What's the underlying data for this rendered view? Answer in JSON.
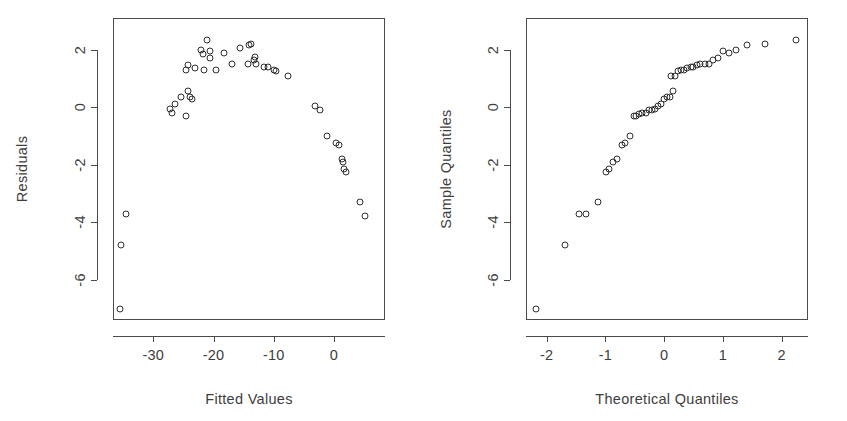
{
  "figure": {
    "background_color": "#ffffff",
    "foreground_color": "#3d3d3d",
    "point_color": "#2e2e2e"
  },
  "chart_data": [
    {
      "type": "scatter",
      "title": "",
      "xlabel": "Fitted Values",
      "ylabel": "Residuals",
      "xlim": [
        -36.7,
        8.5
      ],
      "ylim": [
        -7.4,
        3.1
      ],
      "xticks": [
        -30,
        -20,
        -10,
        0
      ],
      "xticklabels": [
        "-30",
        "-20",
        "-10",
        "0"
      ],
      "yticks": [
        2,
        0,
        -2,
        -4,
        -6
      ],
      "yticklabels": [
        "2",
        "0",
        "-2",
        "-4",
        "-6"
      ],
      "grid": false,
      "legend": "none",
      "marker": "open-circle",
      "n_points": 48,
      "points": [
        [
          -35.5,
          -7.0
        ],
        [
          -35.3,
          -4.8
        ],
        [
          -34.5,
          -3.7
        ],
        [
          -27.2,
          -0.05
        ],
        [
          -26.9,
          -0.2
        ],
        [
          -26.4,
          0.1
        ],
        [
          -25.4,
          0.35
        ],
        [
          -24.6,
          -0.3
        ],
        [
          -24.2,
          0.55
        ],
        [
          -23.9,
          0.35
        ],
        [
          -23.5,
          0.3
        ],
        [
          -24.2,
          1.45
        ],
        [
          -24.6,
          1.3
        ],
        [
          -23.0,
          1.35
        ],
        [
          -22.0,
          2.0
        ],
        [
          -21.7,
          1.85
        ],
        [
          -21.5,
          1.3
        ],
        [
          -21.0,
          2.35
        ],
        [
          -20.6,
          1.95
        ],
        [
          -20.5,
          1.7
        ],
        [
          -19.6,
          1.3
        ],
        [
          -18.3,
          1.9
        ],
        [
          -17.0,
          1.5
        ],
        [
          -15.6,
          2.05
        ],
        [
          -14.1,
          2.15
        ],
        [
          -13.7,
          2.2
        ],
        [
          -13.3,
          1.65
        ],
        [
          -13.1,
          1.75
        ],
        [
          -13.0,
          1.5
        ],
        [
          -14.2,
          1.5
        ],
        [
          -11.6,
          1.4
        ],
        [
          -11.0,
          1.4
        ],
        [
          -9.9,
          1.3
        ],
        [
          -9.6,
          1.25
        ],
        [
          -7.6,
          1.1
        ],
        [
          -3.1,
          0.05
        ],
        [
          -2.3,
          -0.1
        ],
        [
          -1.1,
          -1.0
        ],
        [
          0.3,
          -1.25
        ],
        [
          0.8,
          -1.3
        ],
        [
          1.4,
          -1.8
        ],
        [
          1.6,
          -1.9
        ],
        [
          1.7,
          -2.15
        ],
        [
          2.0,
          -2.25
        ],
        [
          4.3,
          -3.3
        ],
        [
          5.2,
          -3.8
        ]
      ]
    },
    {
      "type": "scatter",
      "title": "",
      "xlabel": "Theoretical Quantiles",
      "ylabel": "Sample Quantiles",
      "xlim": [
        -2.35,
        2.45
      ],
      "ylim": [
        -7.4,
        3.1
      ],
      "xticks": [
        -2,
        -1,
        0,
        1,
        2
      ],
      "xticklabels": [
        "-2",
        "-1",
        "0",
        "1",
        "2"
      ],
      "yticks": [
        2,
        0,
        -2,
        -4,
        -6
      ],
      "yticklabels": [
        "2",
        "0",
        "-2",
        "-4",
        "-6"
      ],
      "grid": false,
      "legend": "none",
      "marker": "open-circle",
      "n_points": 46,
      "points": [
        [
          -2.18,
          -7.0
        ],
        [
          -1.68,
          -4.8
        ],
        [
          -1.44,
          -3.7
        ],
        [
          -1.33,
          -3.7
        ],
        [
          -1.12,
          -3.3
        ],
        [
          -0.98,
          -2.25
        ],
        [
          -0.93,
          -2.15
        ],
        [
          -0.87,
          -1.9
        ],
        [
          -0.8,
          -1.8
        ],
        [
          -0.72,
          -1.3
        ],
        [
          -0.66,
          -1.25
        ],
        [
          -0.58,
          -1.0
        ],
        [
          -0.52,
          -0.3
        ],
        [
          -0.47,
          -0.3
        ],
        [
          -0.42,
          -0.25
        ],
        [
          -0.37,
          -0.2
        ],
        [
          -0.31,
          -0.2
        ],
        [
          -0.26,
          -0.1
        ],
        [
          -0.21,
          -0.1
        ],
        [
          -0.16,
          -0.05
        ],
        [
          -0.1,
          0.05
        ],
        [
          -0.05,
          0.1
        ],
        [
          0.0,
          0.3
        ],
        [
          0.05,
          0.35
        ],
        [
          0.1,
          0.35
        ],
        [
          0.15,
          0.55
        ],
        [
          0.12,
          1.1
        ],
        [
          0.18,
          1.1
        ],
        [
          0.24,
          1.25
        ],
        [
          0.29,
          1.3
        ],
        [
          0.34,
          1.3
        ],
        [
          0.39,
          1.35
        ],
        [
          0.45,
          1.4
        ],
        [
          0.5,
          1.4
        ],
        [
          0.56,
          1.45
        ],
        [
          0.62,
          1.5
        ],
        [
          0.69,
          1.5
        ],
        [
          0.76,
          1.5
        ],
        [
          0.84,
          1.65
        ],
        [
          0.92,
          1.7
        ],
        [
          1.0,
          1.95
        ],
        [
          1.1,
          1.9
        ],
        [
          1.23,
          2.0
        ],
        [
          1.42,
          2.15
        ],
        [
          1.72,
          2.2
        ],
        [
          2.25,
          2.35
        ]
      ]
    }
  ]
}
